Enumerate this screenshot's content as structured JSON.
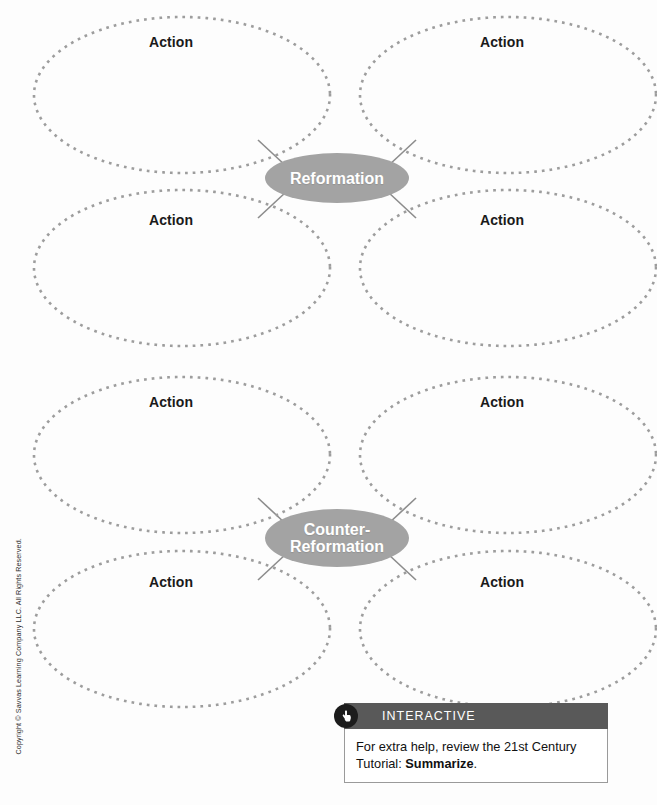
{
  "worksheet": {
    "title": "Reformation and Counter-Reformation Graphic Organizer",
    "action_label": "Action",
    "hub_color": "#a3a3a3",
    "dot_color": "#9d9d9d",
    "connector_color": "#8c8c8c"
  },
  "clusters": [
    {
      "id": "reformation",
      "hub": {
        "lines": [
          "Reformation"
        ],
        "cx": 337,
        "cy": 178,
        "rx": 72,
        "ry": 25
      },
      "ovals": [
        {
          "id": "reformation-action-top-left",
          "label": "Action",
          "cx": 182,
          "cy": 95,
          "rx": 148,
          "ry": 78,
          "label_x": 171,
          "label_y": 42
        },
        {
          "id": "reformation-action-top-right",
          "label": "Action",
          "cx": 508,
          "cy": 95,
          "rx": 148,
          "ry": 78,
          "label_x": 502,
          "label_y": 42
        },
        {
          "id": "reformation-action-bottom-left",
          "label": "Action",
          "cx": 182,
          "cy": 268,
          "rx": 148,
          "ry": 78,
          "label_x": 171,
          "label_y": 220
        },
        {
          "id": "reformation-action-bottom-right",
          "label": "Action",
          "cx": 508,
          "cy": 268,
          "rx": 148,
          "ry": 78,
          "label_x": 502,
          "label_y": 220
        }
      ]
    },
    {
      "id": "counter-reformation",
      "hub": {
        "lines": [
          "Counter-",
          "Reformation"
        ],
        "cx": 337,
        "cy": 538,
        "rx": 72,
        "ry": 29
      },
      "ovals": [
        {
          "id": "counter-action-top-left",
          "label": "Action",
          "cx": 182,
          "cy": 455,
          "rx": 148,
          "ry": 78,
          "label_x": 171,
          "label_y": 402
        },
        {
          "id": "counter-action-top-right",
          "label": "Action",
          "cx": 508,
          "cy": 455,
          "rx": 148,
          "ry": 78,
          "label_x": 502,
          "label_y": 402
        },
        {
          "id": "counter-action-bottom-left",
          "label": "Action",
          "cx": 182,
          "cy": 629,
          "rx": 148,
          "ry": 78,
          "label_x": 171,
          "label_y": 582
        },
        {
          "id": "counter-action-bottom-right",
          "label": "Action",
          "cx": 508,
          "cy": 629,
          "rx": 148,
          "ry": 78,
          "label_x": 502,
          "label_y": 582
        }
      ]
    }
  ],
  "connectors": [
    {
      "x1": 286,
      "y1": 166,
      "x2": 258,
      "y2": 140
    },
    {
      "x1": 388,
      "y1": 166,
      "x2": 416,
      "y2": 140
    },
    {
      "x1": 286,
      "y1": 192,
      "x2": 258,
      "y2": 218
    },
    {
      "x1": 388,
      "y1": 192,
      "x2": 416,
      "y2": 218
    },
    {
      "x1": 286,
      "y1": 524,
      "x2": 258,
      "y2": 498
    },
    {
      "x1": 388,
      "y1": 524,
      "x2": 416,
      "y2": 498
    },
    {
      "x1": 286,
      "y1": 554,
      "x2": 258,
      "y2": 580
    },
    {
      "x1": 388,
      "y1": 554,
      "x2": 416,
      "y2": 580
    }
  ],
  "interactive": {
    "banner_label": "INTERACTIVE",
    "icon": "pointing-hand-icon",
    "banner_color": "#595959",
    "badge_color": "#1c1c1c",
    "body_text_prefix": "For extra help, review the 21st Century Tutorial: ",
    "body_text_bold": "Summarize",
    "body_text_suffix": "."
  },
  "copyright": {
    "text": "Copyright © Savvas Learning Company LLC. All Rights Reserved."
  }
}
